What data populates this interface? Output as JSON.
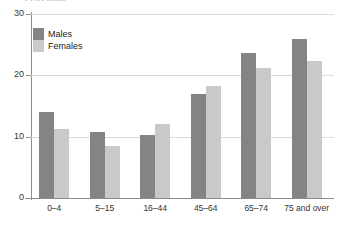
{
  "chart": {
    "clipped_top_label": "Percentage",
    "legend": {
      "position": "top-left-inside",
      "entries": [
        {
          "label": "Males",
          "color": "#848484",
          "icon": "legend-swatch-males"
        },
        {
          "label": "Females",
          "color": "#c9c9c9",
          "icon": "legend-swatch-females"
        }
      ]
    }
  },
  "chart_data": {
    "type": "bar",
    "title": "",
    "subtitle": "",
    "xlabel": "",
    "ylabel": "",
    "categories": [
      "0–4",
      "5–15",
      "16–44",
      "45–64",
      "65–74",
      "75 and over"
    ],
    "series": [
      {
        "name": "Males",
        "color": "#848484",
        "values": [
          14.0,
          10.8,
          10.2,
          16.9,
          23.6,
          26.0
        ]
      },
      {
        "name": "Females",
        "color": "#c9c9c9",
        "values": [
          11.3,
          8.5,
          12.1,
          18.3,
          21.2,
          22.3
        ]
      }
    ],
    "ylim": [
      0,
      30
    ],
    "yticks": [
      0,
      10,
      20,
      30
    ],
    "ytick_labels": [
      "0",
      "10",
      "20",
      "30"
    ],
    "grid": true,
    "grid_axis": "y",
    "legend_position": "upper left",
    "background": "#ffffff"
  }
}
